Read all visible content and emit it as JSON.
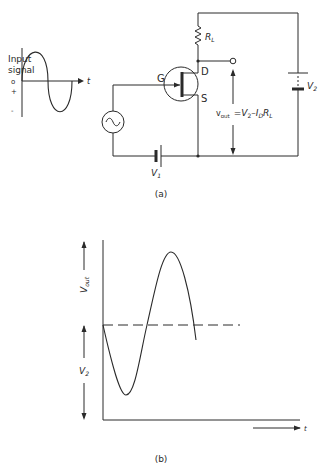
{
  "figure_a": {
    "caption": "(a)",
    "input_signal": {
      "title_line1": "Input",
      "title_line2": "signal",
      "plus_label": "+",
      "zero_label": "o",
      "minus_label": "-",
      "time_label": "t"
    },
    "transistor": {
      "gate_label": "G",
      "drain_label": "D",
      "source_label": "S"
    },
    "resistor_label": "R",
    "resistor_sub": "L",
    "battery_v1_label": "V",
    "battery_v1_sub": "1",
    "battery_v2_label": "V",
    "battery_v2_sub": "2",
    "vout_label": "v",
    "vout_sub": "out",
    "vout_equation_prefix": "=V",
    "vout_equation_sub1": "2",
    "vout_equation_mid": "–I",
    "vout_equation_sub2": "D",
    "vout_equation_r": "R",
    "vout_equation_sub3": "L"
  },
  "figure_b": {
    "caption": "(b)",
    "ylabel_upper": "V",
    "ylabel_upper_sub": "out",
    "ylabel_lower": "V",
    "ylabel_lower_sub": "2",
    "xlabel": "t"
  },
  "colors": {
    "ink": "#2a2a2a",
    "background": "#ffffff"
  }
}
